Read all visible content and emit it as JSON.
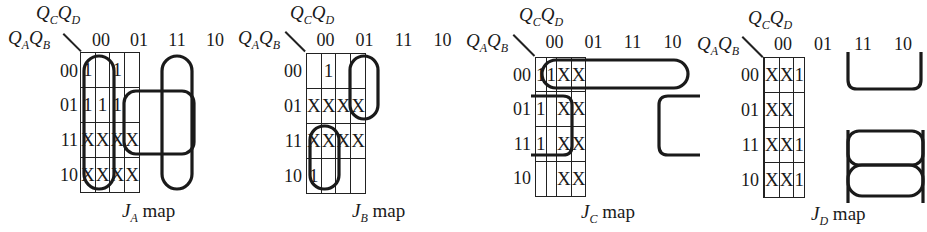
{
  "figure": {
    "row_variables": {
      "main": "Q",
      "sub1": "A",
      "main2": "Q",
      "sub2": "B"
    },
    "col_variables": {
      "main": "Q",
      "sub1": "C",
      "main2": "Q",
      "sub2": "D"
    },
    "col_labels": [
      "00",
      "01",
      "11",
      "10"
    ],
    "row_labels": [
      "00",
      "01",
      "11",
      "10"
    ]
  },
  "maps": [
    {
      "caption_main": "J",
      "caption_sub": "A",
      "caption_suffix": " map",
      "cells": [
        [
          "1",
          "",
          "1",
          ""
        ],
        [
          "1",
          "1",
          "1",
          ""
        ],
        [
          "X",
          "X",
          "X",
          "X"
        ],
        [
          "X",
          "X",
          "X",
          "X"
        ]
      ]
    },
    {
      "caption_main": "J",
      "caption_sub": "B",
      "caption_suffix": " map",
      "cells": [
        [
          "",
          "1",
          "",
          ""
        ],
        [
          "X",
          "X",
          "X",
          "X"
        ],
        [
          "X",
          "X",
          "X",
          "X"
        ],
        [
          "1",
          "",
          "",
          ""
        ]
      ]
    },
    {
      "caption_main": "J",
      "caption_sub": "C",
      "caption_suffix": " map",
      "cells": [
        [
          "1",
          "1",
          "X",
          "X"
        ],
        [
          "1",
          "",
          "X",
          "X"
        ],
        [
          "1",
          "",
          "X",
          "X"
        ],
        [
          "",
          "",
          "X",
          "X"
        ]
      ]
    },
    {
      "caption_main": "J",
      "caption_sub": "D",
      "caption_suffix": " map",
      "cells": [
        [
          "",
          "X",
          "X",
          "1"
        ],
        [
          "",
          "X",
          "X",
          ""
        ],
        [
          "",
          "X",
          "X",
          "1"
        ],
        [
          "",
          "X",
          "X",
          "1"
        ]
      ]
    }
  ]
}
